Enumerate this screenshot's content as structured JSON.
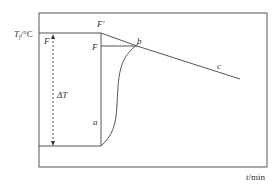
{
  "diagram": {
    "type": "thermometric-titration-curve",
    "y_axis_label": {
      "symbol": "T",
      "subscript": "f",
      "unit": "/°C"
    },
    "x_axis_label": {
      "symbol": "t",
      "unit": "/min"
    },
    "points": {
      "F_prime": "F′",
      "F": "F",
      "F_left": "F",
      "b": "b",
      "a": "a",
      "c": "c"
    },
    "delta_label": "ΔT",
    "colors": {
      "line": "#555555",
      "text": "#333333",
      "background": "#ffffff"
    }
  }
}
